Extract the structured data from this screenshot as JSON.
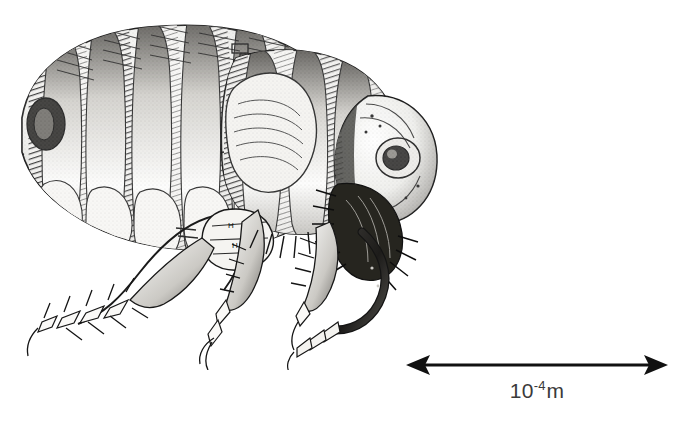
{
  "figure": {
    "kind": "scientific-illustration-plate",
    "background_color": "#ffffff",
    "subject_common_name": "flea",
    "illustration_style": "black-and-white stipple / engraving line drawing",
    "ink_color": "#1a1a1a"
  },
  "specimen": {
    "orientation": "lateral view, head to the right, abdomen to the left",
    "parts": [
      "abdomen with overlapping segmented tergites",
      "thorax plates",
      "head with compound eye",
      "mouthparts / proboscis with bristles",
      "three pairs of spiny legs with terminal claws",
      "coxa and femur bearing small H-shaped reference marks",
      "dense posterior bristles"
    ]
  },
  "scale_bar": {
    "label_mantissa": "10",
    "label_exponent": "-4",
    "label_unit": "m",
    "label_full": "10–4 m",
    "arrow_style": "double-headed",
    "arrow_color": "#111111",
    "label_color": "#3a3a3a",
    "length_px": 258,
    "represents": "10–4 m"
  }
}
